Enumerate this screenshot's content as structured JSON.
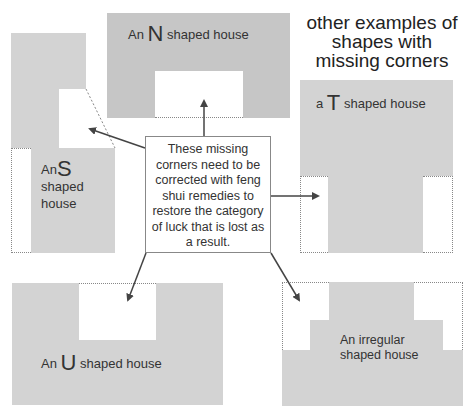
{
  "title": {
    "line1": "other examples of",
    "line2": "shapes with",
    "line3": "missing corners"
  },
  "center_note": {
    "lines": [
      "These missing",
      "corners need to be",
      "corrected with feng",
      "shui remedies to",
      "restore the category",
      "of luck that is lost as",
      "a result."
    ]
  },
  "houses": {
    "n": {
      "prefix": "An",
      "letter": "N",
      "suffix": "shaped house"
    },
    "s": {
      "prefix": "An",
      "letter": "S",
      "line2": "shaped",
      "line3": "house"
    },
    "t": {
      "prefix": "a",
      "letter": "T",
      "suffix": "shaped house"
    },
    "u": {
      "prefix": "An",
      "letter": "U",
      "suffix": "shaped house"
    },
    "irregular": {
      "line1": "An irregular",
      "line2": "shaped house"
    }
  },
  "colors": {
    "house_fill": "#d3d3d3",
    "house_fill_dark": "#c6c6c6",
    "missing_corner": "#ffffff",
    "arrow": "#444444"
  }
}
